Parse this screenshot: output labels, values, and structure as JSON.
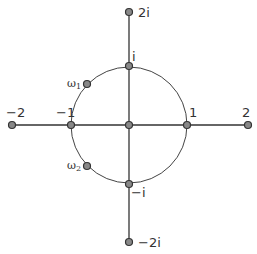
{
  "diagram": {
    "colors": {
      "line": "#333333",
      "point_fill": "#888888",
      "point_stroke": "#333333",
      "text": "#333333"
    },
    "center": {
      "x": 129,
      "y": 125
    },
    "radius": 58,
    "points": [
      {
        "id": "neg2",
        "label": "−2",
        "x": 12,
        "y": 125,
        "lx": 6,
        "ly": 117
      },
      {
        "id": "neg1",
        "label": "−1",
        "x": 71,
        "y": 125,
        "lx": 56,
        "ly": 117
      },
      {
        "id": "origin",
        "label": "",
        "x": 129,
        "y": 125,
        "lx": 0,
        "ly": 0
      },
      {
        "id": "one",
        "label": "1",
        "x": 187,
        "y": 125,
        "lx": 189,
        "ly": 117
      },
      {
        "id": "two",
        "label": "2",
        "x": 248,
        "y": 125,
        "lx": 242,
        "ly": 117
      },
      {
        "id": "two_i",
        "label": "2i",
        "x": 129,
        "y": 12,
        "lx": 138,
        "ly": 17
      },
      {
        "id": "i",
        "label": "i",
        "x": 129,
        "y": 66,
        "lx": 132,
        "ly": 61
      },
      {
        "id": "neg_i",
        "label": "−i",
        "x": 129,
        "y": 184,
        "lx": 131,
        "ly": 197
      },
      {
        "id": "neg2_i",
        "label": "−2i",
        "x": 129,
        "y": 242,
        "lx": 138,
        "ly": 247
      }
    ],
    "omega": [
      {
        "id": "omega1",
        "label": "ω",
        "sub": "1",
        "x": 87,
        "y": 84,
        "lx": 67,
        "ly": 87
      },
      {
        "id": "omega2",
        "label": "ω",
        "sub": "2",
        "x": 87,
        "y": 166,
        "lx": 67,
        "ly": 169
      }
    ]
  }
}
